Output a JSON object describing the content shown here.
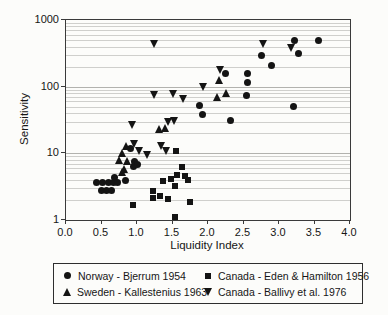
{
  "chart_data": {
    "type": "scatter",
    "title": "",
    "xlabel": "Liquidity Index",
    "ylabel": "Sensitivity",
    "marker_color": "#141414",
    "grid": "horizontal log gridlines on, vertical off",
    "legend_position": "bottom box, 2 columns",
    "x_axis": {
      "min": 0.0,
      "max": 4.0,
      "tick_step": 0.5,
      "tick_labels": [
        "0.0",
        "0.5",
        "1.0",
        "1.5",
        "2.0",
        "2.5",
        "3.0",
        "3.5",
        "4.0"
      ]
    },
    "y_axis": {
      "scale": "log",
      "min": 1,
      "max": 1000,
      "tick_values": [
        1,
        10,
        100,
        1000
      ],
      "tick_labels": [
        "1",
        "10",
        "100",
        "1000"
      ]
    },
    "series": [
      {
        "name": "Norway - Bjerrum 1954",
        "marker": "circle",
        "points": [
          [
            0.43,
            3.6
          ],
          [
            0.52,
            3.6
          ],
          [
            0.6,
            3.6
          ],
          [
            0.67,
            3.6
          ],
          [
            0.73,
            3.6
          ],
          [
            0.5,
            2.8
          ],
          [
            0.57,
            2.8
          ],
          [
            0.64,
            2.8
          ],
          [
            0.68,
            4.4
          ],
          [
            0.84,
            3.9
          ],
          [
            0.91,
            12
          ],
          [
            0.95,
            6.3
          ],
          [
            0.97,
            7.5
          ],
          [
            1.0,
            6.8
          ],
          [
            1.88,
            52
          ],
          [
            1.92,
            38
          ],
          [
            2.25,
            157
          ],
          [
            2.31,
            31
          ],
          [
            2.54,
            73
          ],
          [
            2.56,
            160
          ],
          [
            2.56,
            115
          ],
          [
            2.75,
            290
          ],
          [
            2.89,
            205
          ],
          [
            3.2,
            50
          ],
          [
            3.22,
            500
          ],
          [
            3.28,
            310
          ],
          [
            3.55,
            500
          ]
        ]
      },
      {
        "name": "Canada - Eden & Hamilton 1956",
        "marker": "square",
        "points": [
          [
            0.94,
            1.7
          ],
          [
            1.22,
            2.7
          ],
          [
            1.22,
            2.15
          ],
          [
            1.33,
            2.3
          ],
          [
            1.43,
            2.05
          ],
          [
            1.36,
            3.9
          ],
          [
            1.48,
            4.1
          ],
          [
            1.53,
            3.2
          ],
          [
            1.56,
            4.7
          ],
          [
            1.67,
            4.5
          ],
          [
            1.72,
            4.0
          ],
          [
            1.55,
            11
          ],
          [
            1.64,
            6.2
          ],
          [
            1.74,
            1.85
          ],
          [
            1.53,
            1.1
          ]
        ]
      },
      {
        "name": "Sweden - Kallestenius 1963",
        "marker": "triangle-up",
        "points": [
          [
            0.76,
            8
          ],
          [
            0.8,
            10
          ],
          [
            0.8,
            5.2
          ],
          [
            0.83,
            5.8
          ],
          [
            0.85,
            13
          ],
          [
            0.86,
            7.8
          ],
          [
            1.32,
            23
          ],
          [
            1.4,
            24
          ],
          [
            2.14,
            70
          ],
          [
            2.26,
            80
          ],
          [
            2.16,
            124
          ]
        ]
      },
      {
        "name": "Canada - Ballivy et al. 1976",
        "marker": "triangle-down",
        "points": [
          [
            0.94,
            27
          ],
          [
            0.97,
            14
          ],
          [
            1.04,
            11
          ],
          [
            1.15,
            9.5
          ],
          [
            1.24,
            75
          ],
          [
            1.24,
            440
          ],
          [
            1.34,
            13
          ],
          [
            1.42,
            11
          ],
          [
            1.44,
            30
          ],
          [
            1.53,
            31
          ],
          [
            1.52,
            78
          ],
          [
            1.66,
            66
          ],
          [
            1.94,
            100
          ],
          [
            2.17,
            180
          ],
          [
            2.78,
            430
          ],
          [
            3.17,
            375
          ]
        ]
      }
    ]
  }
}
